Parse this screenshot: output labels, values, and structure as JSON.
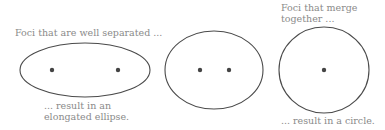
{
  "labels": {
    "top_left": "Foci that are well separated ...",
    "bottom_left_line1": "... result in an",
    "bottom_left_line2": "elongated ellipse.",
    "top_right_line1": "Foci that merge",
    "top_right_line2": "together ...",
    "bottom_right": "... result in a circle."
  },
  "colors": {
    "stroke": "#4a4a4a",
    "focus": "#444444",
    "text": "#8a8a8a",
    "background": "#ffffff"
  },
  "shapes": [
    {
      "name": "elongated-ellipse",
      "cx": 85,
      "cy": 70,
      "rx": 65,
      "ry": 27,
      "foci": [
        [
          52,
          70
        ],
        [
          118,
          70
        ]
      ]
    },
    {
      "name": "moderate-ellipse",
      "cx": 214,
      "cy": 70,
      "rx": 49,
      "ry": 39,
      "foci": [
        [
          200,
          70
        ],
        [
          229,
          70
        ]
      ]
    },
    {
      "name": "circle",
      "cx": 324,
      "cy": 70,
      "rx": 45,
      "ry": 43,
      "foci": [
        [
          324,
          70
        ]
      ]
    }
  ]
}
